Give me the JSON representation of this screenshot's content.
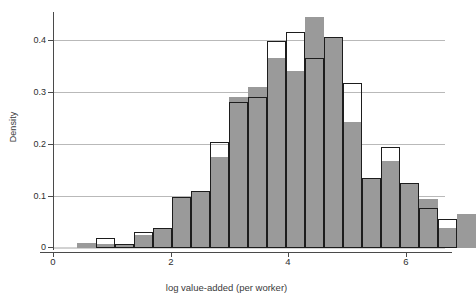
{
  "chart_data": {
    "type": "bar",
    "title": "",
    "subtitle": "",
    "xlabel": "log value-added (per worker)",
    "ylabel": "Density",
    "xlim": [
      -0.25,
      6.7
    ],
    "ylim": [
      0,
      0.46
    ],
    "xticks": [
      0,
      2,
      4,
      6
    ],
    "xtick_labels": [
      "0",
      "2",
      "4",
      "6"
    ],
    "yticks": [
      0,
      0.1,
      0.2,
      0.3,
      0.4
    ],
    "ytick_labels": [
      "0",
      "0.1",
      "0.2",
      "0.3",
      "0.4"
    ],
    "grid": "horizontal",
    "legend": "none",
    "bin_width": 0.324,
    "bin_left_edges": [
      0.41,
      0.734,
      1.058,
      1.382,
      1.706,
      2.03,
      2.354,
      2.678,
      3.002,
      3.326,
      3.65,
      3.974,
      4.298,
      4.622,
      4.946,
      5.27,
      5.594,
      5.918,
      6.242,
      6.566
    ],
    "series": [
      {
        "name": "filled-histogram",
        "style": "filled-gray",
        "color": "#9a9a9a",
        "values": [
          0.01,
          0.008,
          0.008,
          0.025,
          0.038,
          0.098,
          0.11,
          0.175,
          0.29,
          0.31,
          0.365,
          0.34,
          0.444,
          0.405,
          0.242,
          0.135,
          0.167,
          0.125,
          0.095,
          0.038,
          0.065
        ]
      },
      {
        "name": "outline-histogram",
        "style": "open-outline",
        "color": "#1d1d1d",
        "values": [
          0.0,
          0.02,
          0.008,
          0.03,
          0.038,
          0.098,
          0.11,
          0.204,
          0.28,
          0.29,
          0.398,
          0.415,
          0.365,
          0.405,
          0.318,
          0.135,
          0.194,
          0.125,
          0.077,
          0.055,
          0.0
        ]
      }
    ]
  },
  "axes": {
    "y_axis_name": "density-axis",
    "x_axis_name": "log-value-added-axis"
  }
}
